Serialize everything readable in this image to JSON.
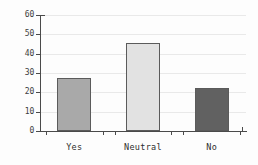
{
  "chart_data": {
    "type": "bar",
    "title": "",
    "xlabel": "",
    "ylabel": "",
    "categories": [
      "Yes",
      "Neutral",
      "No"
    ],
    "values": [
      27.5,
      45.5,
      22
    ],
    "series": [
      {
        "name": "Response",
        "values": [
          27.5,
          45.5,
          22
        ]
      }
    ],
    "bar_colors": [
      "#a9a9a9",
      "#e2e2e2",
      "#616161"
    ],
    "bar_edge_color": "#5b5b5b",
    "ylim": [
      0,
      60
    ],
    "yticks": [
      0,
      10,
      20,
      30,
      40,
      50,
      60
    ],
    "ytick_labels": [
      "0",
      "10",
      "20",
      "30",
      "40",
      "50",
      "60"
    ],
    "grid": true,
    "grid_axis": "y",
    "grid_color": "#e9e9e9",
    "legend": false,
    "legend_position": "none",
    "axis_color": "#4a4a4a",
    "background": "#fdfdfd"
  },
  "axes": {
    "y": {
      "ticks": [
        {
          "value": 0,
          "label": "0"
        },
        {
          "value": 10,
          "label": "10"
        },
        {
          "value": 20,
          "label": "20"
        },
        {
          "value": 30,
          "label": "30"
        },
        {
          "value": 40,
          "label": "40"
        },
        {
          "value": 50,
          "label": "50"
        },
        {
          "value": 60,
          "label": "60"
        }
      ]
    },
    "x": {
      "ticks": [
        {
          "label": "Yes"
        },
        {
          "label": "Neutral"
        },
        {
          "label": "No"
        }
      ]
    }
  }
}
